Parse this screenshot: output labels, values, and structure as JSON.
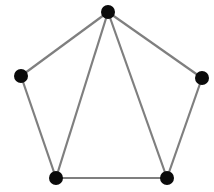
{
  "diagram": {
    "type": "node-link-graph",
    "background_color": "#ffffff",
    "canvas": {
      "width": 214,
      "height": 192
    },
    "style": {
      "vertex_color": "#0a0a0a",
      "vertex_radius": 7,
      "edge_color": "#7f7f7f",
      "edge_width": 2.2
    },
    "vertices": [
      {
        "id": "v-top",
        "label": "top vertex",
        "x": 108,
        "y": 12,
        "degree": 4
      },
      {
        "id": "v-left",
        "label": "left vertex",
        "x": 21,
        "y": 76,
        "degree": 2
      },
      {
        "id": "v-right",
        "label": "right vertex",
        "x": 202,
        "y": 78,
        "degree": 2
      },
      {
        "id": "v-bottom-left",
        "label": "bottom left vertex",
        "x": 56,
        "y": 178,
        "degree": 3
      },
      {
        "id": "v-bottom-right",
        "label": "bottom right vertex",
        "x": 167,
        "y": 178,
        "degree": 3
      }
    ],
    "edges": [
      {
        "id": "e-top-left",
        "from": "v-top",
        "to": "v-left",
        "x1": 108,
        "y1": 12,
        "x2": 21,
        "y2": 76
      },
      {
        "id": "e-top-bottom-left",
        "from": "v-top",
        "to": "v-bottom-left",
        "x1": 108,
        "y1": 12,
        "x2": 56,
        "y2": 178
      },
      {
        "id": "e-top-bottom-right",
        "from": "v-top",
        "to": "v-bottom-right",
        "x1": 108,
        "y1": 12,
        "x2": 167,
        "y2": 178
      },
      {
        "id": "e-top-right",
        "from": "v-top",
        "to": "v-right",
        "x1": 108,
        "y1": 12,
        "x2": 202,
        "y2": 78
      },
      {
        "id": "e-left-bottom-left",
        "from": "v-left",
        "to": "v-bottom-left",
        "x1": 21,
        "y1": 76,
        "x2": 56,
        "y2": 178
      },
      {
        "id": "e-right-bottom-right",
        "from": "v-right",
        "to": "v-bottom-right",
        "x1": 202,
        "y1": 78,
        "x2": 167,
        "y2": 178
      },
      {
        "id": "e-bottom-left-bottom-right",
        "from": "v-bottom-left",
        "to": "v-bottom-right",
        "x1": 56,
        "y1": 178,
        "x2": 167,
        "y2": 178
      }
    ],
    "counts": {
      "vertices": 5,
      "edges": 7
    }
  }
}
